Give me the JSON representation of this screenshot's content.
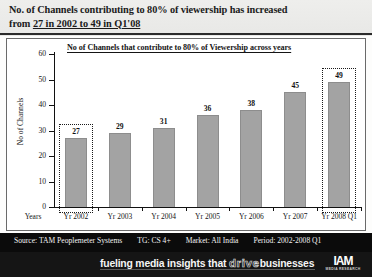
{
  "header": {
    "line1": "No. of Channels contributing to 80% of viewership has increased",
    "line2_prefix": "from ",
    "line2_underlined": "27 in 2002 to 49 in Q1'08"
  },
  "chart_data": {
    "type": "bar",
    "title": "No of Channels that contribute to 80% of Viewership across years",
    "xlabel": "Years",
    "ylabel": "No of Channels",
    "ylim": [
      0,
      60
    ],
    "yticks": [
      0,
      10,
      20,
      30,
      40,
      50,
      60
    ],
    "grid": false,
    "legend": "none",
    "categories": [
      "Yr 2002",
      "Yr 2003",
      "Yr 2004",
      "Yr 2005",
      "Yr 2006",
      "Yr 2007",
      "Yr 2008 Q1"
    ],
    "values": [
      27,
      29,
      31,
      36,
      38,
      45,
      49
    ],
    "bar_color": "#a3a3a3",
    "highlighted": [
      "Yr 2002",
      "Yr 2008 Q1"
    ],
    "annotations": [
      "Yr 2002 bar highlighted with dotted box",
      "Yr 2008 Q1 bar highlighted with dotted box"
    ]
  },
  "footer": {
    "source": "Source: TAM Peoplemeter Systems",
    "target_group": "TG: CS 4+",
    "market": "Market: All India",
    "period": "Period: 2002-2008 Q1",
    "tagline_pre": "fueling media insights that ",
    "tagline_hollow": "drive",
    "tagline_post": "businesses",
    "logo_mark": "IAM",
    "logo_sub": "MEDIA RESEARCH"
  }
}
